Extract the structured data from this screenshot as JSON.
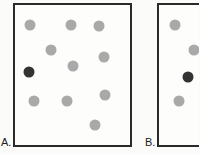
{
  "panels": [
    {
      "label": "A.",
      "dots": [
        {
          "x": 30,
          "y": 25,
          "type": "light"
        },
        {
          "x": 71,
          "y": 25,
          "type": "light"
        },
        {
          "x": 99,
          "y": 26,
          "type": "light"
        },
        {
          "x": 51,
          "y": 50,
          "type": "light"
        },
        {
          "x": 104,
          "y": 57,
          "type": "light"
        },
        {
          "x": 73,
          "y": 66,
          "type": "light"
        },
        {
          "x": 29,
          "y": 72,
          "type": "dark"
        },
        {
          "x": 34,
          "y": 101,
          "type": "light"
        },
        {
          "x": 67,
          "y": 101,
          "type": "light"
        },
        {
          "x": 105,
          "y": 95,
          "type": "light"
        },
        {
          "x": 95,
          "y": 125,
          "type": "light"
        }
      ]
    },
    {
      "label": "B.",
      "dots": [
        {
          "x": 175,
          "y": 25,
          "type": "light"
        },
        {
          "x": 194,
          "y": 50,
          "type": "light"
        },
        {
          "x": 188,
          "y": 77,
          "type": "dark"
        },
        {
          "x": 179,
          "y": 101,
          "type": "light"
        }
      ]
    }
  ],
  "colors": {
    "light_dot": "#a9a9a9",
    "dark_dot": "#333333",
    "border": "#2a2a2a"
  }
}
